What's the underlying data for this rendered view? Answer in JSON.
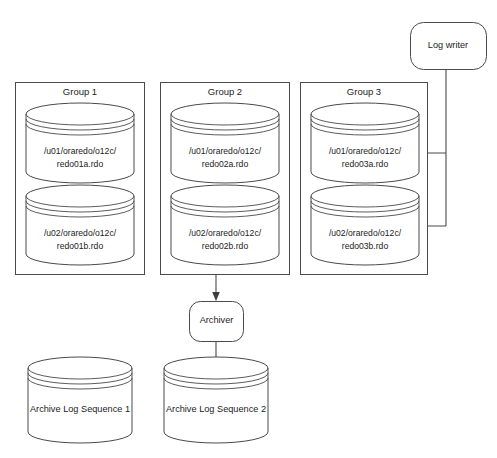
{
  "diagram": {
    "colors": {
      "stroke": "#4a4a4a",
      "text": "#1c1c1c",
      "background": "#ffffff",
      "arrowhead": "#3d3d3d"
    }
  },
  "log_writer": {
    "label": "Log writer",
    "shape": "rounded-rectangle"
  },
  "archiver": {
    "label": "Archiver",
    "shape": "rounded-rectangle"
  },
  "groups": [
    {
      "label": "Group 1",
      "members": [
        {
          "line1": "/u01/oraredo/o12c/",
          "line2": "redo01a.rdo"
        },
        {
          "line1": "/u02/oraredo/o12c/",
          "line2": "redo01b.rdo"
        }
      ]
    },
    {
      "label": "Group 2",
      "members": [
        {
          "line1": "/u01/oraredo/o12c/",
          "line2": "redo02a.rdo"
        },
        {
          "line1": "/u02/oraredo/o12c/",
          "line2": "redo02b.rdo"
        }
      ]
    },
    {
      "label": "Group 3",
      "members": [
        {
          "line1": "/u01/oraredo/o12c/",
          "line2": "redo03a.rdo"
        },
        {
          "line1": "/u02/oraredo/o12c/",
          "line2": "redo03b.rdo"
        }
      ]
    }
  ],
  "archive_logs": [
    {
      "label": "Archive Log Sequence 1"
    },
    {
      "label": "Archive Log Sequence 2"
    }
  ],
  "connectors": [
    {
      "name": "log-writer-to-group3-member-a",
      "from": "Log writer",
      "to": "/u01/oraredo/o12c/redo03a.rdo"
    },
    {
      "name": "log-writer-to-group3-member-b",
      "from": "Log writer",
      "to": "/u02/oraredo/o12c/redo03b.rdo"
    },
    {
      "name": "group2-to-archiver",
      "from": "/u02/oraredo/o12c/redo02b.rdo",
      "to": "Archiver"
    },
    {
      "name": "archiver-to-archive-log-2",
      "from": "Archiver",
      "to": "Archive Log Sequence 2"
    }
  ]
}
